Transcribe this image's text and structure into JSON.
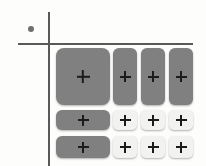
{
  "canvas": {
    "width": 206,
    "height": 166,
    "background": "#fdfdfc"
  },
  "axes": {
    "color": "#595959",
    "vertical": {
      "name": "vertical-axis",
      "x": 48,
      "y_start": 12,
      "y_end": 166
    },
    "horizontal": {
      "name": "horizontal-axis",
      "y": 43,
      "x_start": 18,
      "x_end": 193
    }
  },
  "origin_marker": {
    "name": "origin-dot",
    "color": "#6f6f6f",
    "x": 31,
    "y": 29,
    "diameter": 6
  },
  "palette": {
    "button_gray": "#808080",
    "button_light": "#f2f2f0",
    "plus_glyph": "#1c1c1c",
    "axis": "#595959",
    "dot": "#6f6f6f"
  },
  "grid": {
    "rows": 3,
    "columns": 4,
    "buttons": [
      {
        "id": "r1c1",
        "row": 1,
        "col": 1,
        "style": "gray",
        "size": "large",
        "icon": "plus-icon",
        "label": "+"
      },
      {
        "id": "r1c2",
        "row": 1,
        "col": 2,
        "style": "gray",
        "size": "tall",
        "icon": "plus-icon",
        "label": "+"
      },
      {
        "id": "r1c3",
        "row": 1,
        "col": 3,
        "style": "gray",
        "size": "tall",
        "icon": "plus-icon",
        "label": "+"
      },
      {
        "id": "r1c4",
        "row": 1,
        "col": 4,
        "style": "gray",
        "size": "tall",
        "icon": "plus-icon",
        "label": "+"
      },
      {
        "id": "r2c1",
        "row": 2,
        "col": 1,
        "style": "gray",
        "size": "wide",
        "icon": "plus-icon",
        "label": "+"
      },
      {
        "id": "r2c2",
        "row": 2,
        "col": 2,
        "style": "light",
        "size": "small",
        "icon": "plus-icon",
        "label": "+"
      },
      {
        "id": "r2c3",
        "row": 2,
        "col": 3,
        "style": "light",
        "size": "small",
        "icon": "plus-icon",
        "label": "+"
      },
      {
        "id": "r2c4",
        "row": 2,
        "col": 4,
        "style": "light",
        "size": "small",
        "icon": "plus-icon",
        "label": "+"
      },
      {
        "id": "r3c1",
        "row": 3,
        "col": 1,
        "style": "gray",
        "size": "wide",
        "icon": "plus-icon",
        "label": "+"
      },
      {
        "id": "r3c2",
        "row": 3,
        "col": 2,
        "style": "light",
        "size": "small",
        "icon": "plus-icon",
        "label": "+"
      },
      {
        "id": "r3c3",
        "row": 3,
        "col": 3,
        "style": "light",
        "size": "small",
        "icon": "plus-icon",
        "label": "+"
      },
      {
        "id": "r3c4",
        "row": 3,
        "col": 4,
        "style": "light",
        "size": "small",
        "icon": "plus-icon",
        "label": "+"
      }
    ]
  }
}
